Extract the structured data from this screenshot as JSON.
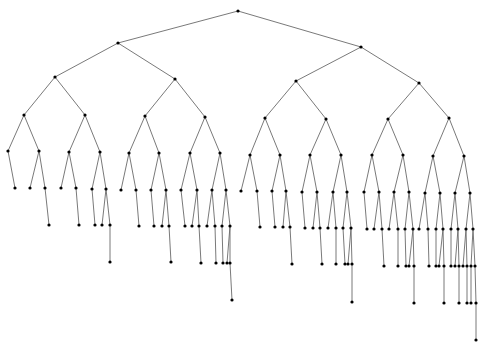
{
  "diagram": {
    "type": "tree",
    "width": 485,
    "height": 343,
    "edge_color": "#6a6a6a",
    "node_color": "#000000",
    "node_radius": 1.6,
    "nodes": {
      "r": [
        238,
        11
      ],
      "L": [
        118,
        43
      ],
      "R": [
        361,
        47
      ],
      "LL": [
        55,
        77
      ],
      "LR": [
        175,
        79
      ],
      "RL": [
        296,
        81
      ],
      "RR": [
        419,
        83
      ],
      "LLL": [
        24,
        115
      ],
      "LLR": [
        85,
        115
      ],
      "LRL": [
        145,
        116
      ],
      "LRR": [
        205,
        117
      ],
      "RLL": [
        265,
        118
      ],
      "RLR": [
        326,
        119
      ],
      "RRL": [
        388,
        119
      ],
      "RRR": [
        449,
        118
      ],
      "a1": [
        8,
        151
      ],
      "a2": [
        39,
        151
      ],
      "a1a": [
        15,
        188
      ],
      "a2a": [
        30,
        188
      ],
      "a2b": [
        45,
        188
      ],
      "a2b1": [
        49,
        225
      ],
      "b1": [
        69,
        152
      ],
      "b2": [
        100,
        152
      ],
      "b1a": [
        61,
        188
      ],
      "b1b": [
        76,
        188
      ],
      "b1b1": [
        79,
        225
      ],
      "b2a": [
        92,
        189
      ],
      "b2b": [
        106,
        189
      ],
      "b2a1": [
        95,
        225
      ],
      "b2b1": [
        102,
        225
      ],
      "b2b2": [
        110,
        225
      ],
      "b2b2a": [
        110,
        262
      ],
      "c1": [
        129,
        153
      ],
      "c2": [
        159,
        153
      ],
      "c1a": [
        121,
        190
      ],
      "c1b": [
        136,
        190
      ],
      "c1b1": [
        139,
        226
      ],
      "c2a": [
        151,
        190
      ],
      "c2b": [
        166,
        190
      ],
      "c2a1": [
        154,
        226
      ],
      "c2b1": [
        162,
        226
      ],
      "c2b2": [
        169,
        226
      ],
      "c2b2a": [
        171,
        262
      ],
      "d1": [
        190,
        153
      ],
      "d2": [
        220,
        153
      ],
      "d1a": [
        181,
        190
      ],
      "d1b": [
        197,
        190
      ],
      "d1a1": [
        185,
        226
      ],
      "d1b1": [
        192,
        226
      ],
      "d1b2": [
        199,
        226
      ],
      "d1b2a": [
        201,
        263
      ],
      "d2a": [
        212,
        190
      ],
      "d2b": [
        226,
        190
      ],
      "d2a1": [
        207,
        226
      ],
      "d2a2": [
        215,
        226
      ],
      "d2a2a": [
        216,
        263
      ],
      "d2b1": [
        222,
        226
      ],
      "d2b2": [
        230,
        226
      ],
      "d2b1a": [
        223,
        263
      ],
      "d2b2a": [
        227,
        263
      ],
      "d2b2b": [
        230,
        263
      ],
      "d2b2b1": [
        232,
        300
      ],
      "e1": [
        250,
        155
      ],
      "e2": [
        280,
        155
      ],
      "e1a": [
        241,
        191
      ],
      "e1b": [
        257,
        191
      ],
      "e1b1": [
        260,
        227
      ],
      "e2a": [
        272,
        191
      ],
      "e2b": [
        286,
        191
      ],
      "e2a1": [
        275,
        227
      ],
      "e2b1": [
        283,
        227
      ],
      "e2b2": [
        290,
        227
      ],
      "e2b2a": [
        292,
        264
      ],
      "f1": [
        310,
        155
      ],
      "f2": [
        341,
        155
      ],
      "f1a": [
        302,
        192
      ],
      "f1b": [
        317,
        192
      ],
      "f1a1": [
        305,
        228
      ],
      "f1b1": [
        313,
        228
      ],
      "f1b2": [
        320,
        228
      ],
      "f1b2a": [
        322,
        264
      ],
      "f2a": [
        333,
        192
      ],
      "f2b": [
        347,
        192
      ],
      "f2a1": [
        328,
        228
      ],
      "f2a2": [
        336,
        228
      ],
      "f2a2a": [
        336,
        264
      ],
      "f2b1": [
        343,
        228
      ],
      "f2b2": [
        351,
        228
      ],
      "f2b1a": [
        345,
        264
      ],
      "f2b2a": [
        348,
        264
      ],
      "f2b2b": [
        352,
        264
      ],
      "f2b2b1": [
        352,
        302
      ],
      "g1": [
        372,
        155
      ],
      "g2": [
        403,
        155
      ],
      "g1a": [
        364,
        192
      ],
      "g1b": [
        379,
        192
      ],
      "g1a1": [
        367,
        229
      ],
      "g1b1": [
        374,
        229
      ],
      "g1b2": [
        382,
        229
      ],
      "g1b2a": [
        384,
        266
      ],
      "g2a": [
        394,
        192
      ],
      "g2b": [
        409,
        192
      ],
      "g2a1": [
        389,
        229
      ],
      "g2a2": [
        398,
        229
      ],
      "g2a2a": [
        398,
        266
      ],
      "g2b1": [
        405,
        229
      ],
      "g2b2": [
        413,
        229
      ],
      "g2b1a": [
        406,
        266
      ],
      "g2b2a": [
        409,
        266
      ],
      "g2b2b": [
        414,
        266
      ],
      "g2b2b1": [
        414,
        303
      ],
      "h1": [
        433,
        156
      ],
      "h2": [
        464,
        156
      ],
      "h1a": [
        425,
        193
      ],
      "h1b": [
        440,
        193
      ],
      "h1a1": [
        419,
        229
      ],
      "h1a2": [
        428,
        229
      ],
      "h1a2a": [
        429,
        266
      ],
      "h1b1": [
        436,
        229
      ],
      "h1b2": [
        443,
        229
      ],
      "h1b1a": [
        436,
        266
      ],
      "h1b2a": [
        439,
        266
      ],
      "h1b2b": [
        444,
        266
      ],
      "h1b2b1": [
        444,
        303
      ],
      "h2a": [
        455,
        193
      ],
      "h2b": [
        470,
        193
      ],
      "h2a1": [
        451,
        229
      ],
      "h2a2": [
        458,
        229
      ],
      "h2a1a": [
        451,
        266
      ],
      "h2a2a": [
        455,
        266
      ],
      "h2a2b": [
        459,
        266
      ],
      "h2a2b1": [
        459,
        303
      ],
      "h2b1": [
        466,
        229
      ],
      "h2b2": [
        473,
        229
      ],
      "h2b1a": [
        463,
        266
      ],
      "h2b1b": [
        467,
        266
      ],
      "h2b1b1": [
        467,
        303
      ],
      "h2b2a": [
        471,
        266
      ],
      "h2b2b": [
        475,
        266
      ],
      "h2b2a1": [
        471,
        303
      ],
      "h2b2b1": [
        476,
        303
      ],
      "h2b2b1a": [
        476,
        340
      ]
    },
    "edges": [
      [
        "r",
        "L"
      ],
      [
        "r",
        "R"
      ],
      [
        "L",
        "LL"
      ],
      [
        "L",
        "LR"
      ],
      [
        "R",
        "RL"
      ],
      [
        "R",
        "RR"
      ],
      [
        "LL",
        "LLL"
      ],
      [
        "LL",
        "LLR"
      ],
      [
        "LR",
        "LRL"
      ],
      [
        "LR",
        "LRR"
      ],
      [
        "RL",
        "RLL"
      ],
      [
        "RL",
        "RLR"
      ],
      [
        "RR",
        "RRL"
      ],
      [
        "RR",
        "RRR"
      ],
      [
        "LLL",
        "a1"
      ],
      [
        "LLL",
        "a2"
      ],
      [
        "a1",
        "a1a"
      ],
      [
        "a2",
        "a2a"
      ],
      [
        "a2",
        "a2b"
      ],
      [
        "a2b",
        "a2b1"
      ],
      [
        "LLR",
        "b1"
      ],
      [
        "LLR",
        "b2"
      ],
      [
        "b1",
        "b1a"
      ],
      [
        "b1",
        "b1b"
      ],
      [
        "b1b",
        "b1b1"
      ],
      [
        "b2",
        "b2a"
      ],
      [
        "b2",
        "b2b"
      ],
      [
        "b2a",
        "b2a1"
      ],
      [
        "b2b",
        "b2b1"
      ],
      [
        "b2b",
        "b2b2"
      ],
      [
        "b2b2",
        "b2b2a"
      ],
      [
        "LRL",
        "c1"
      ],
      [
        "LRL",
        "c2"
      ],
      [
        "c1",
        "c1a"
      ],
      [
        "c1",
        "c1b"
      ],
      [
        "c1b",
        "c1b1"
      ],
      [
        "c2",
        "c2a"
      ],
      [
        "c2",
        "c2b"
      ],
      [
        "c2a",
        "c2a1"
      ],
      [
        "c2b",
        "c2b1"
      ],
      [
        "c2b",
        "c2b2"
      ],
      [
        "c2b2",
        "c2b2a"
      ],
      [
        "LRR",
        "d1"
      ],
      [
        "LRR",
        "d2"
      ],
      [
        "d1",
        "d1a"
      ],
      [
        "d1",
        "d1b"
      ],
      [
        "d1a",
        "d1a1"
      ],
      [
        "d1b",
        "d1b1"
      ],
      [
        "d1b",
        "d1b2"
      ],
      [
        "d1b2",
        "d1b2a"
      ],
      [
        "d2",
        "d2a"
      ],
      [
        "d2",
        "d2b"
      ],
      [
        "d2a",
        "d2a1"
      ],
      [
        "d2a",
        "d2a2"
      ],
      [
        "d2a2",
        "d2a2a"
      ],
      [
        "d2b",
        "d2b1"
      ],
      [
        "d2b",
        "d2b2"
      ],
      [
        "d2b1",
        "d2b1a"
      ],
      [
        "d2b2",
        "d2b2a"
      ],
      [
        "d2b2",
        "d2b2b"
      ],
      [
        "d2b2b",
        "d2b2b1"
      ],
      [
        "RLL",
        "e1"
      ],
      [
        "RLL",
        "e2"
      ],
      [
        "e1",
        "e1a"
      ],
      [
        "e1",
        "e1b"
      ],
      [
        "e1b",
        "e1b1"
      ],
      [
        "e2",
        "e2a"
      ],
      [
        "e2",
        "e2b"
      ],
      [
        "e2a",
        "e2a1"
      ],
      [
        "e2b",
        "e2b1"
      ],
      [
        "e2b",
        "e2b2"
      ],
      [
        "e2b2",
        "e2b2a"
      ],
      [
        "RLR",
        "f1"
      ],
      [
        "RLR",
        "f2"
      ],
      [
        "f1",
        "f1a"
      ],
      [
        "f1",
        "f1b"
      ],
      [
        "f1a",
        "f1a1"
      ],
      [
        "f1b",
        "f1b1"
      ],
      [
        "f1b",
        "f1b2"
      ],
      [
        "f1b2",
        "f1b2a"
      ],
      [
        "f2",
        "f2a"
      ],
      [
        "f2",
        "f2b"
      ],
      [
        "f2a",
        "f2a1"
      ],
      [
        "f2a",
        "f2a2"
      ],
      [
        "f2a2",
        "f2a2a"
      ],
      [
        "f2b",
        "f2b1"
      ],
      [
        "f2b",
        "f2b2"
      ],
      [
        "f2b1",
        "f2b1a"
      ],
      [
        "f2b2",
        "f2b2a"
      ],
      [
        "f2b2",
        "f2b2b"
      ],
      [
        "f2b2b",
        "f2b2b1"
      ],
      [
        "RRL",
        "g1"
      ],
      [
        "RRL",
        "g2"
      ],
      [
        "g1",
        "g1a"
      ],
      [
        "g1",
        "g1b"
      ],
      [
        "g1a",
        "g1a1"
      ],
      [
        "g1b",
        "g1b1"
      ],
      [
        "g1b",
        "g1b2"
      ],
      [
        "g1b2",
        "g1b2a"
      ],
      [
        "g2",
        "g2a"
      ],
      [
        "g2",
        "g2b"
      ],
      [
        "g2a",
        "g2a1"
      ],
      [
        "g2a",
        "g2a2"
      ],
      [
        "g2a2",
        "g2a2a"
      ],
      [
        "g2b",
        "g2b1"
      ],
      [
        "g2b",
        "g2b2"
      ],
      [
        "g2b1",
        "g2b1a"
      ],
      [
        "g2b2",
        "g2b2a"
      ],
      [
        "g2b2",
        "g2b2b"
      ],
      [
        "g2b2b",
        "g2b2b1"
      ],
      [
        "RRR",
        "h1"
      ],
      [
        "RRR",
        "h2"
      ],
      [
        "h1",
        "h1a"
      ],
      [
        "h1",
        "h1b"
      ],
      [
        "h1a",
        "h1a1"
      ],
      [
        "h1a",
        "h1a2"
      ],
      [
        "h1a2",
        "h1a2a"
      ],
      [
        "h1b",
        "h1b1"
      ],
      [
        "h1b",
        "h1b2"
      ],
      [
        "h1b1",
        "h1b1a"
      ],
      [
        "h1b2",
        "h1b2a"
      ],
      [
        "h1b2",
        "h1b2b"
      ],
      [
        "h1b2b",
        "h1b2b1"
      ],
      [
        "h2",
        "h2a"
      ],
      [
        "h2",
        "h2b"
      ],
      [
        "h2a",
        "h2a1"
      ],
      [
        "h2a",
        "h2a2"
      ],
      [
        "h2a1",
        "h2a1a"
      ],
      [
        "h2a2",
        "h2a2a"
      ],
      [
        "h2a2",
        "h2a2b"
      ],
      [
        "h2a2b",
        "h2a2b1"
      ],
      [
        "h2b",
        "h2b1"
      ],
      [
        "h2b",
        "h2b2"
      ],
      [
        "h2b1",
        "h2b1a"
      ],
      [
        "h2b1",
        "h2b1b"
      ],
      [
        "h2b1b",
        "h2b1b1"
      ],
      [
        "h2b2",
        "h2b2a"
      ],
      [
        "h2b2",
        "h2b2b"
      ],
      [
        "h2b2a",
        "h2b2a1"
      ],
      [
        "h2b2b",
        "h2b2b1"
      ],
      [
        "h2b2b1",
        "h2b2b1a"
      ]
    ]
  }
}
